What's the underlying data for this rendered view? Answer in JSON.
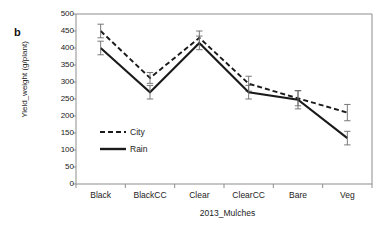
{
  "figure": {
    "panel_label": "b",
    "background": "#ffffff",
    "line_color": "#1a1a1a"
  },
  "chart_data": {
    "type": "line",
    "title": "",
    "subtitle": "",
    "xlabel": "2013_Mulches",
    "ylabel": "Yield_weight (g/plant)",
    "categories": [
      "Black",
      "BlackCC",
      "Clear",
      "ClearCC",
      "Bare",
      "Veg"
    ],
    "ylim": [
      0,
      500
    ],
    "yticks": [
      0,
      50,
      100,
      150,
      200,
      250,
      300,
      350,
      400,
      450,
      500
    ],
    "ytick_labels": [
      "0",
      "50",
      "100",
      "150",
      "200",
      "250",
      "300",
      "350",
      "400",
      "450",
      "500"
    ],
    "grid": false,
    "legend_position": "inside-lower-left",
    "series": [
      {
        "name": "City",
        "style": "dashed",
        "color": "#1a1a1a",
        "values": [
          450,
          312,
          430,
          295,
          252,
          210
        ],
        "errors": [
          20,
          16,
          20,
          22,
          22,
          24
        ]
      },
      {
        "name": "Rain",
        "style": "solid",
        "color": "#1a1a1a",
        "values": [
          400,
          270,
          415,
          270,
          248,
          135
        ],
        "errors": [
          20,
          20,
          20,
          20,
          27,
          20
        ]
      }
    ]
  }
}
